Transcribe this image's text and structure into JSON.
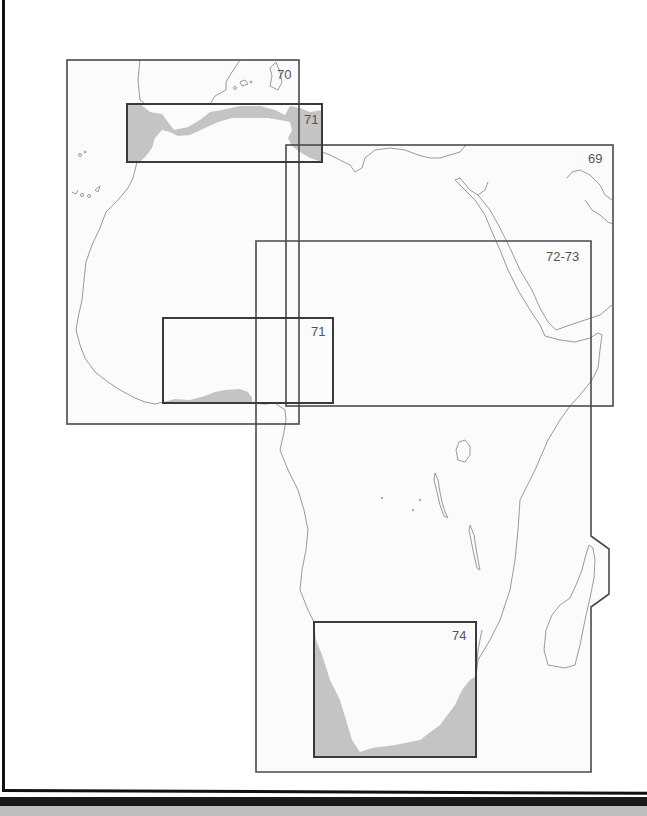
{
  "map": {
    "title": "Africa chart index",
    "colors": {
      "land_outline": "#9a9a9a",
      "sheet_border": "#4a4a4a",
      "coverage_fill": "#c4c4c4",
      "background": "#ffffff",
      "frame": "#111111"
    },
    "sheets": [
      {
        "id": "70",
        "label": "70",
        "region": "Northwest Africa / Iberia"
      },
      {
        "id": "71a",
        "label": "71",
        "region": "Strait of Gibraltar / Western Mediterranean coast",
        "inset": true
      },
      {
        "id": "69",
        "label": "69",
        "region": "North Africa / Red Sea / Arabia"
      },
      {
        "id": "72-73",
        "label": "72-73",
        "region": "Central and East Africa / Horn of Africa"
      },
      {
        "id": "71b",
        "label": "71",
        "region": "Gulf of Guinea coast",
        "inset": true
      },
      {
        "id": "74",
        "label": "74",
        "region": "Southern Africa",
        "inset": true
      }
    ]
  }
}
